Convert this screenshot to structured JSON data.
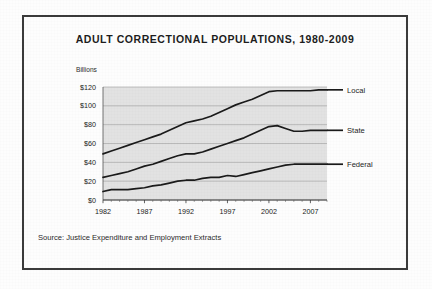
{
  "figure": {
    "title": "ADULT CORRECTIONAL POPULATIONS, 1980-2009",
    "y_unit_label": "Billions",
    "source_note": "Source: Justice Expenditure and Employment Extracts",
    "frame_color": "#3b3b3b",
    "plot_background_color": "#e2e2e2",
    "gridline_color": "#a8a8a8",
    "line_color": "#1a1a1a"
  },
  "chart_data": {
    "type": "line",
    "title": "ADULT CORRECTIONAL POPULATIONS, 1980-2009",
    "xlabel": "",
    "ylabel": "Billions",
    "ylim": [
      0,
      120
    ],
    "xlim": [
      1982,
      2009
    ],
    "grid": true,
    "legend_position": "right-of-axes-inline",
    "ytick_labels": [
      "$0",
      "$20",
      "$40",
      "$60",
      "$80",
      "$100",
      "$120"
    ],
    "ytick_values": [
      0,
      20,
      40,
      60,
      80,
      100,
      120
    ],
    "xtick_labels": [
      "1982",
      "1987",
      "1992",
      "1997",
      "2002",
      "2007"
    ],
    "xtick_values": [
      1982,
      1987,
      1992,
      1997,
      2002,
      2007
    ],
    "x": [
      1982,
      1983,
      1984,
      1985,
      1986,
      1987,
      1988,
      1989,
      1990,
      1991,
      1992,
      1993,
      1994,
      1995,
      1996,
      1997,
      1998,
      1999,
      2000,
      2001,
      2002,
      2003,
      2004,
      2005,
      2006,
      2007,
      2008,
      2009
    ],
    "series": [
      {
        "name": "Local",
        "values": [
          49,
          52,
          55,
          58,
          61,
          64,
          67,
          70,
          74,
          78,
          82,
          84,
          86,
          89,
          93,
          97,
          101,
          104,
          107,
          111,
          115,
          116,
          116,
          116,
          116,
          116,
          117,
          117
        ]
      },
      {
        "name": "State",
        "values": [
          24,
          26,
          28,
          30,
          33,
          36,
          38,
          41,
          44,
          47,
          49,
          49,
          51,
          54,
          57,
          60,
          63,
          66,
          70,
          74,
          78,
          79,
          76,
          73,
          73,
          74,
          74,
          74
        ]
      },
      {
        "name": "Federal",
        "values": [
          9,
          11,
          11,
          11,
          12,
          13,
          15,
          16,
          18,
          20,
          21,
          21,
          23,
          24,
          24,
          26,
          25,
          27,
          29,
          31,
          33,
          35,
          37,
          38,
          38,
          38,
          38,
          38
        ]
      }
    ]
  }
}
